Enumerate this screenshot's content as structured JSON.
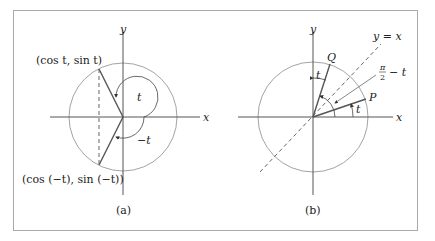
{
  "figure": {
    "panel_a": {
      "caption": "(a)",
      "x_axis_label": "x",
      "y_axis_label": "y",
      "point_upper_label": "(cos t, sin t)",
      "point_lower_label": "(cos (−t), sin (−t))",
      "angle_pos_label": "t",
      "angle_neg_label": "−t"
    },
    "panel_b": {
      "caption": "(b)",
      "x_axis_label": "x",
      "y_axis_label": "y",
      "line_label": "y = x",
      "point_q_label": "Q",
      "point_p_label": "P",
      "angle_q_label": "t",
      "angle_p_label": "t",
      "angle_mid_label_num": "π",
      "angle_mid_label_den": "2",
      "angle_mid_label_rest": "− t"
    }
  }
}
